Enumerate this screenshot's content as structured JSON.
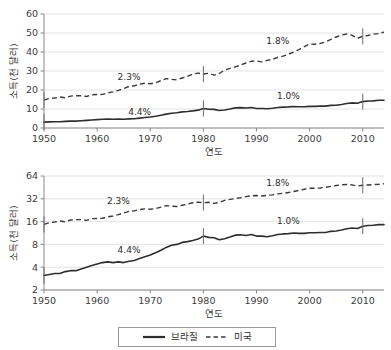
{
  "figure": {
    "legend": {
      "entries": [
        {
          "label": "브라질",
          "style": "solid",
          "color": "#2e2e2e",
          "name": "brazil"
        },
        {
          "label": "미국",
          "style": "dashed",
          "color": "#3a3a3a",
          "name": "united-states"
        }
      ]
    }
  },
  "chart_data": [
    {
      "id": "top-linear",
      "type": "line",
      "title": "",
      "xlabel": "연도",
      "ylabel": "소득(천 달러)",
      "scale": "linear",
      "grid": true,
      "legend_position": "bottom",
      "xlim": [
        1950,
        2014
      ],
      "ylim": [
        0,
        60
      ],
      "xticks": [
        1950,
        1960,
        1970,
        1980,
        1990,
        2000,
        2010
      ],
      "xticklabels": [
        "1950",
        "1960",
        "1970",
        "1980",
        "1990",
        "2000",
        "2010"
      ],
      "yticks": [
        0,
        10,
        20,
        30,
        40,
        50,
        60
      ],
      "yticklabels": [
        "0",
        "10",
        "20",
        "30",
        "40",
        "50",
        "60"
      ],
      "annotations": [
        {
          "text": "2.3%",
          "x": 1966,
          "y": 25.5,
          "series": "미국"
        },
        {
          "text": "1.8%",
          "x": 1994,
          "y": 44.0,
          "series": "미국"
        },
        {
          "text": "4.4%",
          "x": 1968,
          "y": 6.6,
          "series": "브라질"
        },
        {
          "text": "1.0%",
          "x": 1996,
          "y": 15.2,
          "series": "브라질"
        }
      ],
      "markers": [
        {
          "x": 1950,
          "series": "브라질"
        },
        {
          "x": 1980,
          "series": "브라질"
        },
        {
          "x": 2010,
          "series": "브라질"
        },
        {
          "x": 1950,
          "series": "미국"
        },
        {
          "x": 1980,
          "series": "미국"
        },
        {
          "x": 2010,
          "series": "미국"
        }
      ],
      "x": [
        1950,
        1951,
        1952,
        1953,
        1954,
        1955,
        1956,
        1957,
        1958,
        1959,
        1960,
        1961,
        1962,
        1963,
        1964,
        1965,
        1966,
        1967,
        1968,
        1969,
        1970,
        1971,
        1972,
        1973,
        1974,
        1975,
        1976,
        1977,
        1978,
        1979,
        1980,
        1981,
        1982,
        1983,
        1984,
        1985,
        1986,
        1987,
        1988,
        1989,
        1990,
        1991,
        1992,
        1993,
        1994,
        1995,
        1996,
        1997,
        1998,
        1999,
        2000,
        2001,
        2002,
        2003,
        2004,
        2005,
        2006,
        2007,
        2008,
        2009,
        2010,
        2011,
        2012,
        2013,
        2014
      ],
      "series": [
        {
          "name": "브라질",
          "style": "solid",
          "values": [
            3.1,
            3.2,
            3.3,
            3.3,
            3.5,
            3.6,
            3.6,
            3.8,
            4.0,
            4.2,
            4.4,
            4.6,
            4.7,
            4.6,
            4.7,
            4.6,
            4.8,
            4.9,
            5.2,
            5.5,
            5.8,
            6.2,
            6.7,
            7.3,
            7.8,
            8.0,
            8.5,
            8.7,
            9.0,
            9.4,
            10.3,
            9.9,
            9.8,
            9.2,
            9.5,
            10.0,
            10.6,
            10.7,
            10.5,
            10.8,
            10.3,
            10.3,
            10.1,
            10.4,
            10.8,
            11.0,
            11.1,
            11.3,
            11.2,
            11.2,
            11.4,
            11.4,
            11.5,
            11.5,
            11.9,
            12.0,
            12.4,
            12.9,
            13.2,
            13.0,
            13.9,
            14.2,
            14.3,
            14.6,
            14.6
          ]
        },
        {
          "name": "미국",
          "style": "dashed",
          "values": [
            14.7,
            15.5,
            15.8,
            16.3,
            15.9,
            16.8,
            17.0,
            17.0,
            16.6,
            17.5,
            17.6,
            17.7,
            18.5,
            19.0,
            19.8,
            20.8,
            21.9,
            22.2,
            23.1,
            23.6,
            23.3,
            23.8,
            24.9,
            26.0,
            25.6,
            25.3,
            26.3,
            27.2,
            28.4,
            28.9,
            28.4,
            28.8,
            27.8,
            28.7,
            30.5,
            31.4,
            32.2,
            33.1,
            34.2,
            35.1,
            35.3,
            34.8,
            35.6,
            36.1,
            37.2,
            37.8,
            38.8,
            40.0,
            41.3,
            42.8,
            44.2,
            44.1,
            44.5,
            45.3,
            46.7,
            47.9,
            48.9,
            49.5,
            48.8,
            47.2,
            48.3,
            48.7,
            49.4,
            49.7,
            50.5
          ]
        }
      ]
    },
    {
      "id": "bottom-log",
      "type": "line",
      "title": "",
      "xlabel": "연도",
      "ylabel": "소득(천 달러)",
      "scale": "log2",
      "grid": true,
      "legend_position": "bottom",
      "xlim": [
        1950,
        2014
      ],
      "ylim": [
        2,
        64
      ],
      "xticks": [
        1950,
        1960,
        1970,
        1980,
        1990,
        2000,
        2010
      ],
      "xticklabels": [
        "1950",
        "1960",
        "1970",
        "1980",
        "1990",
        "2000",
        "2010"
      ],
      "yticks": [
        2,
        4,
        8,
        16,
        32,
        64
      ],
      "yticklabels": [
        "2",
        "4",
        "8",
        "16",
        "32",
        "64"
      ],
      "annotations": [
        {
          "text": "2.3%",
          "x": 1964,
          "y": 27.0,
          "series": "미국"
        },
        {
          "text": "1.8%",
          "x": 1994,
          "y": 47.0,
          "series": "미국"
        },
        {
          "text": "4.4%",
          "x": 1966,
          "y": 6.1,
          "series": "브라질"
        },
        {
          "text": "1.0%",
          "x": 1996,
          "y": 14.8,
          "series": "브라질"
        }
      ],
      "markers": [
        {
          "x": 1950,
          "series": "브라질"
        },
        {
          "x": 1980,
          "series": "브라질"
        },
        {
          "x": 2010,
          "series": "브라질"
        },
        {
          "x": 1950,
          "series": "미국"
        },
        {
          "x": 1980,
          "series": "미국"
        },
        {
          "x": 2010,
          "series": "미국"
        }
      ],
      "x": [
        1950,
        1951,
        1952,
        1953,
        1954,
        1955,
        1956,
        1957,
        1958,
        1959,
        1960,
        1961,
        1962,
        1963,
        1964,
        1965,
        1966,
        1967,
        1968,
        1969,
        1970,
        1971,
        1972,
        1973,
        1974,
        1975,
        1976,
        1977,
        1978,
        1979,
        1980,
        1981,
        1982,
        1983,
        1984,
        1985,
        1986,
        1987,
        1988,
        1989,
        1990,
        1991,
        1992,
        1993,
        1994,
        1995,
        1996,
        1997,
        1998,
        1999,
        2000,
        2001,
        2002,
        2003,
        2004,
        2005,
        2006,
        2007,
        2008,
        2009,
        2010,
        2011,
        2012,
        2013,
        2014
      ],
      "series": [
        {
          "name": "브라질",
          "style": "solid",
          "values": [
            3.1,
            3.2,
            3.3,
            3.3,
            3.5,
            3.6,
            3.6,
            3.8,
            4.0,
            4.2,
            4.4,
            4.6,
            4.7,
            4.6,
            4.7,
            4.6,
            4.8,
            4.9,
            5.2,
            5.5,
            5.8,
            6.2,
            6.7,
            7.3,
            7.8,
            8.0,
            8.5,
            8.7,
            9.0,
            9.4,
            10.3,
            9.9,
            9.8,
            9.2,
            9.5,
            10.0,
            10.6,
            10.7,
            10.5,
            10.8,
            10.3,
            10.3,
            10.1,
            10.4,
            10.8,
            11.0,
            11.1,
            11.3,
            11.2,
            11.2,
            11.4,
            11.4,
            11.5,
            11.5,
            11.9,
            12.0,
            12.4,
            12.9,
            13.2,
            13.0,
            13.9,
            14.2,
            14.3,
            14.6,
            14.6
          ]
        },
        {
          "name": "미국",
          "style": "dashed",
          "values": [
            14.7,
            15.5,
            15.8,
            16.3,
            15.9,
            16.8,
            17.0,
            17.0,
            16.6,
            17.5,
            17.6,
            17.7,
            18.5,
            19.0,
            19.8,
            20.8,
            21.9,
            22.2,
            23.1,
            23.6,
            23.3,
            23.8,
            24.9,
            26.0,
            25.6,
            25.3,
            26.3,
            27.2,
            28.4,
            28.9,
            28.4,
            28.8,
            27.8,
            28.7,
            30.5,
            31.4,
            32.2,
            33.1,
            34.2,
            35.1,
            35.3,
            34.8,
            35.6,
            36.1,
            37.2,
            37.8,
            38.8,
            40.0,
            41.3,
            42.8,
            44.2,
            44.1,
            44.5,
            45.3,
            46.7,
            47.9,
            48.9,
            49.5,
            48.8,
            47.2,
            48.3,
            48.7,
            49.4,
            49.7,
            50.5
          ]
        }
      ]
    }
  ]
}
